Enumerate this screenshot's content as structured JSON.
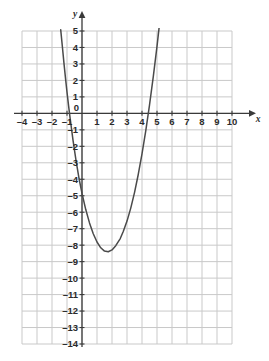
{
  "chart_data": {
    "type": "line",
    "title": "",
    "subtitle": "",
    "xlabel": "x",
    "ylabel": "y",
    "xlim": [
      -4,
      10
    ],
    "ylim": [
      -14,
      5
    ],
    "grid": true,
    "legend": false,
    "x_ticks": [
      "-4",
      "-3",
      "-2",
      "-1",
      "0",
      "1",
      "2",
      "3",
      "4",
      "5",
      "6",
      "7",
      "8",
      "9",
      "10"
    ],
    "x_tick_values": [
      -4,
      -3,
      -2,
      -1,
      0,
      1,
      2,
      3,
      4,
      5,
      6,
      7,
      8,
      9,
      10
    ],
    "y_ticks": [
      "5",
      "4",
      "3",
      "2",
      "1",
      "0",
      "-1",
      "-2",
      "-3",
      "-4",
      "-5",
      "-6",
      "-7",
      "-8",
      "-9",
      "-10",
      "-11",
      "-12",
      "-13",
      "-14"
    ],
    "y_tick_values": [
      5,
      4,
      3,
      2,
      1,
      0,
      -1,
      -2,
      -3,
      -4,
      -5,
      -6,
      -7,
      -8,
      -9,
      -10,
      -11,
      -12,
      -13,
      -14
    ],
    "origin_label": "0",
    "curve_label": "parabola",
    "curve_equation": "y = (x + 0.9)(x - 6)",
    "vertex": [
      2.55,
      -12.2
    ],
    "roots": [
      -0.9,
      6.0
    ],
    "y_intercept": -5.4,
    "series": [
      {
        "name": "parabola",
        "color": "#4a4a4a",
        "x": [
          -1.42,
          -1.3,
          -1.2,
          -1.1,
          -1.0,
          -0.9,
          -0.8,
          -0.6,
          -0.4,
          -0.2,
          0.0,
          0.25,
          0.5,
          0.75,
          1.0,
          1.25,
          1.5,
          1.75,
          2.0,
          2.25,
          2.55,
          2.75,
          3.0,
          3.25,
          3.5,
          3.75,
          4.0,
          4.25,
          4.5,
          4.75,
          5.0,
          5.25,
          5.5,
          5.75,
          6.0,
          6.2,
          6.4,
          6.6,
          6.8,
          7.0,
          7.05
        ],
        "y": [
          5.08,
          3.97,
          3.02,
          2.13,
          1.29,
          0.5,
          -0.24,
          -1.62,
          -2.86,
          -3.94,
          -4.86,
          -5.84,
          -6.65,
          -7.31,
          -7.81,
          -8.16,
          -8.36,
          -8.4,
          -8.29,
          -8.03,
          -7.6,
          -7.17,
          -6.54,
          -5.75,
          -4.81,
          -3.71,
          -2.46,
          -1.06,
          0.5,
          2.21,
          4.07,
          6.09,
          8.26,
          10.59,
          13.07,
          15.18,
          17.38,
          19.68,
          22.08,
          24.58,
          25.22
        ],
        "visible_top_clip": 5,
        "visible_bottom_clip": -14
      }
    ],
    "colors": {
      "curve": "#4a4a4a",
      "grid": "#c9c9c9",
      "axis": "#3a3a3a",
      "tick_text": "#2b2b2b",
      "background": "#ffffff"
    }
  }
}
